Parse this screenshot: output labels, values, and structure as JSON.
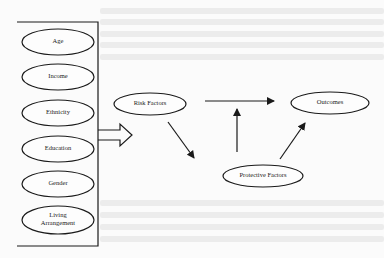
{
  "diagram": {
    "demographics": [
      {
        "id": "age",
        "label": "Age"
      },
      {
        "id": "income",
        "label": "Income"
      },
      {
        "id": "ethnicity",
        "label": "Ethnicity"
      },
      {
        "id": "education",
        "label": "Education"
      },
      {
        "id": "gender",
        "label": "Gender"
      },
      {
        "id": "living-arrangement",
        "label_line1": "Living",
        "label_line2": "Arrangement"
      }
    ],
    "nodes": {
      "risk_factors": "Risk Factors",
      "protective_factors": "Protective Factors",
      "outcomes": "Outcomes"
    },
    "edges": [
      {
        "from": "demographics",
        "to": "risk_factors",
        "style": "block-arrow"
      },
      {
        "from": "risk_factors",
        "to": "outcomes"
      },
      {
        "from": "risk_factors",
        "to": "protective_factors"
      },
      {
        "from": "protective_factors",
        "to": "risk_outcomes_link"
      },
      {
        "from": "protective_factors",
        "to": "outcomes"
      }
    ],
    "colors": {
      "stroke": "#1a1a1a",
      "background": "#fbfbfb",
      "bleed_text": "#ececec"
    }
  }
}
